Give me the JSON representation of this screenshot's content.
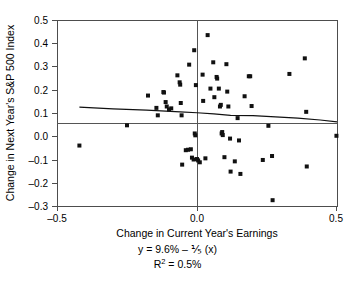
{
  "chart_data": {
    "type": "scatter",
    "title": "",
    "xlabel": "Change in Current Year's Earnings",
    "ylabel": "Change in Next Year's S&P 500 Index",
    "xlim": [
      -0.5,
      0.5
    ],
    "ylim": [
      -0.3,
      0.5
    ],
    "xticks": [
      -0.5,
      0.0,
      0.5
    ],
    "xticklabels": [
      "–0.5",
      "0.0",
      "0.5"
    ],
    "yticks": [
      -0.3,
      -0.2,
      -0.1,
      0.0,
      0.1,
      0.2,
      0.3,
      0.4,
      0.5
    ],
    "yticklabels": [
      "–0.3",
      "–0.2",
      "–0.1",
      "0.0",
      "0.1",
      "0.2",
      "0.3",
      "0.4",
      "0.5"
    ],
    "grid": false,
    "legend": null,
    "zero_lines": {
      "x": 0.0,
      "y": 0.0
    },
    "marker": {
      "shape": "square",
      "color": "#111111",
      "size": 4
    },
    "points": [
      [
        -0.42,
        -0.04
      ],
      [
        -0.25,
        0.047
      ],
      [
        -0.175,
        0.175
      ],
      [
        -0.145,
        0.122
      ],
      [
        -0.14,
        0.09
      ],
      [
        -0.12,
        0.19
      ],
      [
        -0.118,
        0.188
      ],
      [
        -0.112,
        0.147
      ],
      [
        -0.108,
        0.128
      ],
      [
        -0.1,
        0.115
      ],
      [
        -0.092,
        0.12
      ],
      [
        -0.07,
        0.262
      ],
      [
        -0.062,
        0.232
      ],
      [
        -0.06,
        0.222
      ],
      [
        -0.058,
        0.143
      ],
      [
        -0.055,
        0.09
      ],
      [
        -0.053,
        -0.122
      ],
      [
        -0.04,
        -0.06
      ],
      [
        -0.032,
        -0.058
      ],
      [
        -0.028,
        0.308
      ],
      [
        -0.022,
        -0.056
      ],
      [
        -0.018,
        -0.092
      ],
      [
        -0.012,
        -0.1
      ],
      [
        -0.01,
        0.37
      ],
      [
        -0.008,
        0.012
      ],
      [
        -0.006,
        0.004
      ],
      [
        -0.004,
        0.22
      ],
      [
        0.0,
        -0.098
      ],
      [
        0.004,
        -0.104
      ],
      [
        0.01,
        -0.112
      ],
      [
        0.02,
        0.265
      ],
      [
        0.022,
        0.152
      ],
      [
        0.03,
        -0.095
      ],
      [
        0.038,
        0.435
      ],
      [
        0.048,
        0.205
      ],
      [
        0.058,
        0.318
      ],
      [
        0.062,
        0.168
      ],
      [
        0.07,
        0.255
      ],
      [
        0.072,
        0.248
      ],
      [
        0.078,
        0.205
      ],
      [
        0.082,
        0.128
      ],
      [
        0.085,
        0.135
      ],
      [
        0.088,
        0.012
      ],
      [
        0.09,
        0.018
      ],
      [
        0.092,
        0.005
      ],
      [
        0.098,
        -0.09
      ],
      [
        0.105,
        0.31
      ],
      [
        0.108,
        0.192
      ],
      [
        0.112,
        0.128
      ],
      [
        0.118,
        -0.01
      ],
      [
        0.12,
        -0.152
      ],
      [
        0.135,
        -0.108
      ],
      [
        0.145,
        0.078
      ],
      [
        0.15,
        -0.018
      ],
      [
        0.155,
        -0.162
      ],
      [
        0.17,
        0.172
      ],
      [
        0.185,
        0.258
      ],
      [
        0.19,
        0.258
      ],
      [
        0.195,
        0.13
      ],
      [
        0.235,
        -0.102
      ],
      [
        0.255,
        0.045
      ],
      [
        0.268,
        -0.085
      ],
      [
        0.27,
        -0.275
      ],
      [
        0.33,
        0.268
      ],
      [
        0.385,
        0.335
      ],
      [
        0.39,
        0.105
      ],
      [
        0.392,
        -0.13
      ],
      [
        0.498,
        0.002
      ]
    ],
    "fit_line": {
      "label": "regression-line",
      "x": [
        -0.42,
        -0.3,
        -0.18,
        -0.06,
        0.0,
        0.06,
        0.12,
        0.2,
        0.28,
        0.36,
        0.44,
        0.5
      ],
      "y": [
        0.125,
        0.118,
        0.112,
        0.105,
        0.101,
        0.096,
        0.09,
        0.089,
        0.083,
        0.078,
        0.07,
        0.062
      ]
    },
    "annotations": {
      "equation": "y = 9.6% – ⅕ (x)",
      "equation_parts": {
        "lhs": "y = 9.6% – ",
        "fraction": "⅕",
        "rhs": " (x)"
      },
      "r_squared_label": "R",
      "r_squared_exponent": "2",
      "r_squared_value": " = 0.5%"
    }
  }
}
